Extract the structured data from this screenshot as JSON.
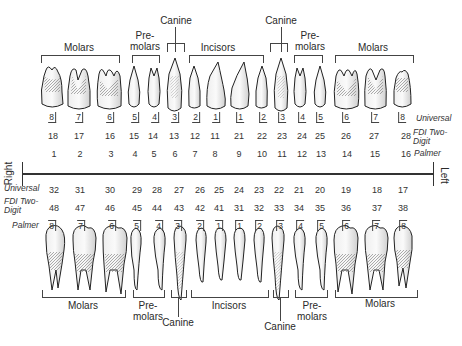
{
  "orientation": {
    "right_label": "Right",
    "left_label": "Left"
  },
  "row_labels": {
    "universal": "Universal",
    "fdi_line1": "FDI Two-",
    "fdi_line2": "Digit",
    "palmer": "Palmer"
  },
  "upper_groups": [
    {
      "name": "Molars",
      "line1": "Molars",
      "line2": ""
    },
    {
      "name": "Premolars-right",
      "line1": "Pre-",
      "line2": "molars"
    },
    {
      "name": "Canine-right",
      "line1": "Canine",
      "line2": ""
    },
    {
      "name": "Incisors",
      "line1": "Incisors",
      "line2": ""
    },
    {
      "name": "Canine-left",
      "line1": "Canine",
      "line2": ""
    },
    {
      "name": "Premolars-left",
      "line1": "Pre-",
      "line2": "molars"
    },
    {
      "name": "Molars-left",
      "line1": "Molars",
      "line2": ""
    }
  ],
  "lower_groups": [
    {
      "name": "Molars",
      "line1": "Molars",
      "line2": ""
    },
    {
      "name": "Premolars-right",
      "line1": "Pre-",
      "line2": "molars"
    },
    {
      "name": "Canine-right",
      "line1": "Canine",
      "line2": ""
    },
    {
      "name": "Incisors",
      "line1": "Incisors",
      "line2": ""
    },
    {
      "name": "Canine-left",
      "line1": "Canine",
      "line2": ""
    },
    {
      "name": "Premolars-left",
      "line1": "Pre-",
      "line2": "molars"
    },
    {
      "name": "Molars-left",
      "line1": "Molars",
      "line2": ""
    }
  ],
  "upper_arch": {
    "palmer": [
      "8",
      "7",
      "6",
      "5",
      "4",
      "3",
      "2",
      "1",
      "1",
      "2",
      "3",
      "4",
      "5",
      "6",
      "7",
      "8"
    ],
    "fdi": [
      "18",
      "17",
      "16",
      "15",
      "14",
      "13",
      "12",
      "11",
      "21",
      "22",
      "23",
      "24",
      "25",
      "26",
      "27",
      "28"
    ],
    "universal": [
      "1",
      "2",
      "3",
      "4",
      "5",
      "6",
      "7",
      "8",
      "9",
      "10",
      "11",
      "12",
      "13",
      "14",
      "15",
      "16"
    ]
  },
  "lower_arch": {
    "universal": [
      "32",
      "31",
      "30",
      "29",
      "28",
      "27",
      "26",
      "25",
      "24",
      "23",
      "22",
      "21",
      "20",
      "19",
      "18",
      "17"
    ],
    "fdi": [
      "48",
      "47",
      "46",
      "45",
      "44",
      "43",
      "42",
      "41",
      "31",
      "32",
      "33",
      "34",
      "35",
      "36",
      "37",
      "38"
    ],
    "palmer": [
      "8",
      "7",
      "6",
      "5",
      "4",
      "3",
      "2",
      "1",
      "1",
      "2",
      "3",
      "4",
      "5",
      "6",
      "7",
      "8"
    ]
  }
}
